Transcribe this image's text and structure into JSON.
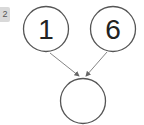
{
  "badge": {
    "label": "2"
  },
  "diagram": {
    "nodes": [
      {
        "id": "left",
        "label": "1"
      },
      {
        "id": "right",
        "label": "6"
      },
      {
        "id": "bottom",
        "label": ""
      }
    ],
    "edges": [
      {
        "from": "left",
        "to": "bottom"
      },
      {
        "from": "right",
        "to": "bottom"
      }
    ],
    "colors": {
      "stroke": "#555555",
      "arrow": "#666666",
      "badge_bg": "#d9d9d9"
    }
  }
}
